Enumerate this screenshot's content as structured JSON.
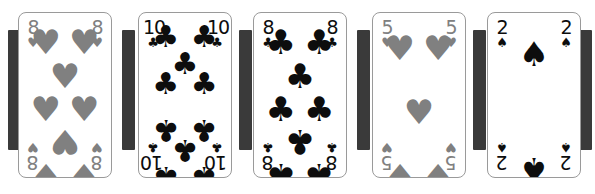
{
  "scene": {
    "width": 595,
    "height": 194,
    "background": "#ffffff",
    "description": "Row of five playing cards laid out left to right with dark vertical bars showing between them"
  },
  "palette": {
    "red_suit_rendered": "#808080",
    "black_suit": "#0d0d0d",
    "card_face": "#ffffff",
    "card_border": "#9a9a9a",
    "separator_bar": "#3a3a3a"
  },
  "glyphs": {
    "hearts": "♥",
    "spades": "♠",
    "clubs": "♣",
    "diamonds": "♦"
  },
  "cards": [
    {
      "id": "card-1",
      "rank": "8",
      "suit": "hearts",
      "suit_symbol": "♥",
      "color": "#808080",
      "label": "Eight of Hearts",
      "left": 18,
      "pip_count": 8
    },
    {
      "id": "card-2",
      "rank": "10",
      "suit": "clubs",
      "suit_symbol": "♣",
      "color": "#0d0d0d",
      "label": "Ten of Clubs",
      "left": 138,
      "pip_count": 10
    },
    {
      "id": "card-3",
      "rank": "8",
      "suit": "clubs",
      "suit_symbol": "♣",
      "color": "#0d0d0d",
      "label": "Eight of Clubs",
      "left": 253,
      "pip_count": 8
    },
    {
      "id": "card-4",
      "rank": "5",
      "suit": "hearts",
      "suit_symbol": "♥",
      "color": "#808080",
      "label": "Five of Hearts",
      "left": 372,
      "pip_count": 5
    },
    {
      "id": "card-5",
      "rank": "2",
      "suit": "spades",
      "suit_symbol": "♠",
      "color": "#0d0d0d",
      "label": "Two of Spades",
      "left": 487,
      "pip_count": 2
    }
  ],
  "bars": [
    {
      "id": "bar-1",
      "left": 8,
      "top": 30,
      "width": 13,
      "height": 120
    },
    {
      "id": "bar-2",
      "left": 122,
      "top": 30,
      "width": 13,
      "height": 120
    },
    {
      "id": "bar-3",
      "left": 239,
      "top": 30,
      "width": 13,
      "height": 120
    },
    {
      "id": "bar-4",
      "left": 357,
      "top": 30,
      "width": 13,
      "height": 120
    },
    {
      "id": "bar-5",
      "left": 473,
      "top": 30,
      "width": 13,
      "height": 120
    },
    {
      "id": "bar-6",
      "left": 578,
      "top": 30,
      "width": 14,
      "height": 120
    }
  ],
  "pip_layouts": {
    "2": [
      {
        "x": 50,
        "y": 12,
        "flip": false
      },
      {
        "x": 50,
        "y": 88,
        "flip": true
      }
    ],
    "5": [
      {
        "x": 18,
        "y": 8,
        "flip": false
      },
      {
        "x": 82,
        "y": 8,
        "flip": false
      },
      {
        "x": 50,
        "y": 50,
        "flip": false
      },
      {
        "x": 18,
        "y": 92,
        "flip": true
      },
      {
        "x": 82,
        "y": 92,
        "flip": true
      }
    ],
    "8": [
      {
        "x": 18,
        "y": 4,
        "flip": false
      },
      {
        "x": 82,
        "y": 4,
        "flip": false
      },
      {
        "x": 50,
        "y": 26,
        "flip": false
      },
      {
        "x": 18,
        "y": 48,
        "flip": false
      },
      {
        "x": 82,
        "y": 48,
        "flip": false
      },
      {
        "x": 50,
        "y": 70,
        "flip": true
      },
      {
        "x": 18,
        "y": 92,
        "flip": true
      },
      {
        "x": 82,
        "y": 92,
        "flip": true
      }
    ],
    "10": [
      {
        "x": 18,
        "y": 2,
        "flip": false
      },
      {
        "x": 82,
        "y": 2,
        "flip": false
      },
      {
        "x": 50,
        "y": 20,
        "flip": false
      },
      {
        "x": 18,
        "y": 33,
        "flip": false
      },
      {
        "x": 82,
        "y": 33,
        "flip": false
      },
      {
        "x": 18,
        "y": 63,
        "flip": true
      },
      {
        "x": 82,
        "y": 63,
        "flip": true
      },
      {
        "x": 50,
        "y": 76,
        "flip": true
      },
      {
        "x": 18,
        "y": 94,
        "flip": true
      },
      {
        "x": 82,
        "y": 94,
        "flip": true
      }
    ]
  }
}
